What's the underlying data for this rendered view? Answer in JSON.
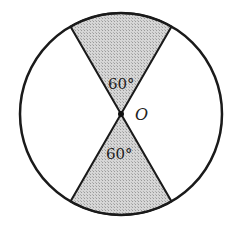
{
  "diagram": {
    "type": "circle-with-vertical-sectors",
    "circle": {
      "cx": 121,
      "cy": 114,
      "r": 101
    },
    "sector_angle_deg": 60,
    "labels": {
      "top_angle": "60°",
      "bottom_angle": "60°",
      "center": "O"
    },
    "colors": {
      "stroke": "#1a1a1a",
      "shade": "#c8c8c8",
      "background": "#ffffff"
    }
  }
}
